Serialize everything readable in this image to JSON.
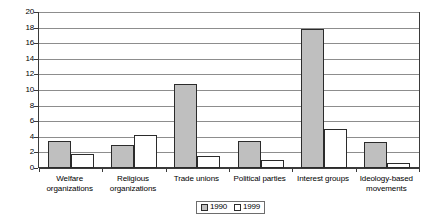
{
  "chart_data": {
    "type": "bar",
    "title": "",
    "subtitle": "",
    "xlabel": "",
    "ylabel": "",
    "ylim": [
      0,
      20
    ],
    "ytick_step": 2,
    "yticks": [
      "0",
      "2",
      "4",
      "6",
      "8",
      "10",
      "12",
      "14",
      "16",
      "18",
      "20"
    ],
    "grid": true,
    "legend_position": "bottom-center",
    "categories": [
      "Welfare organizations",
      "Religious organizations",
      "Trade unions",
      "Political parties",
      "Interest groups",
      "Ideology-based movements"
    ],
    "category_lines": [
      [
        "Welfare",
        "organizations"
      ],
      [
        "Religious",
        "organizations"
      ],
      [
        "Trade unions"
      ],
      [
        "Political parties"
      ],
      [
        "Interest groups"
      ],
      [
        "Ideology-based",
        "movements"
      ]
    ],
    "series": [
      {
        "name": "1990",
        "color": "#bfbfbf",
        "values": [
          3.5,
          3.0,
          10.8,
          3.5,
          18.0,
          3.3
        ]
      },
      {
        "name": "1999",
        "color": "#ffffff",
        "values": [
          1.8,
          4.3,
          1.5,
          1.0,
          5.0,
          0.6
        ]
      }
    ]
  },
  "colors": {
    "series_1990": "#bfbfbf",
    "series_1999": "#ffffff",
    "bar_outline": "#2b2b2b",
    "gridline": "#8d8d8d",
    "axis": "#3a3a3a",
    "background": "#ffffff",
    "text": "#000000"
  }
}
